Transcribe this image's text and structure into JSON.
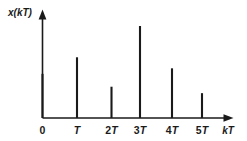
{
  "chart_data": {
    "type": "bar",
    "title": "",
    "subtitle": "",
    "xlabel": "kT",
    "ylabel": "x(kT)",
    "categories": [
      "0",
      "T",
      "2T",
      "3T",
      "4T",
      "5T"
    ],
    "x": [
      0,
      1,
      2,
      3,
      4,
      5
    ],
    "values": [
      0.48,
      0.66,
      0.34,
      1.0,
      0.54,
      0.27
    ],
    "ylim": [
      0,
      1.08
    ],
    "xlim": [
      -0.2,
      6.0
    ],
    "grid": false,
    "legend": null,
    "annotations": [],
    "style_note": "stem/impulse plot of a sampled signal; vertical lines rise from the horizontal kT axis",
    "axis_color": "#1a1a1a",
    "stem_color": "#1a1a1a",
    "background_color": "#ffffff"
  },
  "axes": {
    "y_axis_label": "x(kT)",
    "x_axis_label": "kT",
    "y_axis_has_arrow": true,
    "x_axis_has_arrow": true
  },
  "ticks": [
    {
      "label_prefix": "",
      "label_var": "",
      "label_full": "0",
      "x_index": 0
    },
    {
      "label_prefix": "",
      "label_var": "T",
      "label_full": "T",
      "x_index": 1
    },
    {
      "label_prefix": "2",
      "label_var": "T",
      "label_full": "2T",
      "x_index": 2
    },
    {
      "label_prefix": "3",
      "label_var": "T",
      "label_full": "3T",
      "x_index": 3
    },
    {
      "label_prefix": "4",
      "label_var": "T",
      "label_full": "4T",
      "x_index": 4
    },
    {
      "label_prefix": "5",
      "label_var": "T",
      "label_full": "5T",
      "x_index": 5
    }
  ],
  "ylabel_parts": {
    "x": "x",
    "open": "(",
    "k": "k",
    "T": "T",
    "close": ")"
  },
  "xlabel_parts": {
    "k": "k",
    "T": "T"
  }
}
